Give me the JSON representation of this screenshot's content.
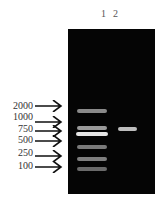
{
  "figure": {
    "lane_labels": [
      {
        "label": "1",
        "x": 101
      },
      {
        "label": "2",
        "x": 113
      }
    ],
    "ladder": [
      {
        "size": "2000",
        "label_y": 101,
        "arrow_y": 106
      },
      {
        "size": "1000",
        "label_y": 112,
        "arrow_y": 122
      },
      {
        "size": "750",
        "label_y": 124,
        "arrow_y": 131
      },
      {
        "size": "500",
        "label_y": 135,
        "arrow_y": 141
      },
      {
        "size": "250",
        "label_y": 148,
        "arrow_y": 156
      },
      {
        "size": "100",
        "label_y": 161,
        "arrow_y": 167
      }
    ],
    "lane1_bands": [
      {
        "marker": "2000",
        "y": 109,
        "x": 77,
        "w": 30,
        "color": "#8a8a8a"
      },
      {
        "marker": "1000",
        "y": 126,
        "x": 77,
        "w": 30,
        "color": "#9a9a9a"
      },
      {
        "marker": "750",
        "y": 132,
        "x": 76,
        "w": 32,
        "color": "#e6e6e6"
      },
      {
        "marker": "500",
        "y": 145,
        "x": 77,
        "w": 30,
        "color": "#7a7a7a"
      },
      {
        "marker": "250",
        "y": 157,
        "x": 77,
        "w": 30,
        "color": "#7f7f7f"
      },
      {
        "marker": "100",
        "y": 167,
        "x": 77,
        "w": 30,
        "color": "#6a6a6a"
      }
    ],
    "lane2_bands": [
      {
        "y": 127,
        "x": 118,
        "w": 19,
        "color": "#bdbdbd"
      }
    ]
  }
}
